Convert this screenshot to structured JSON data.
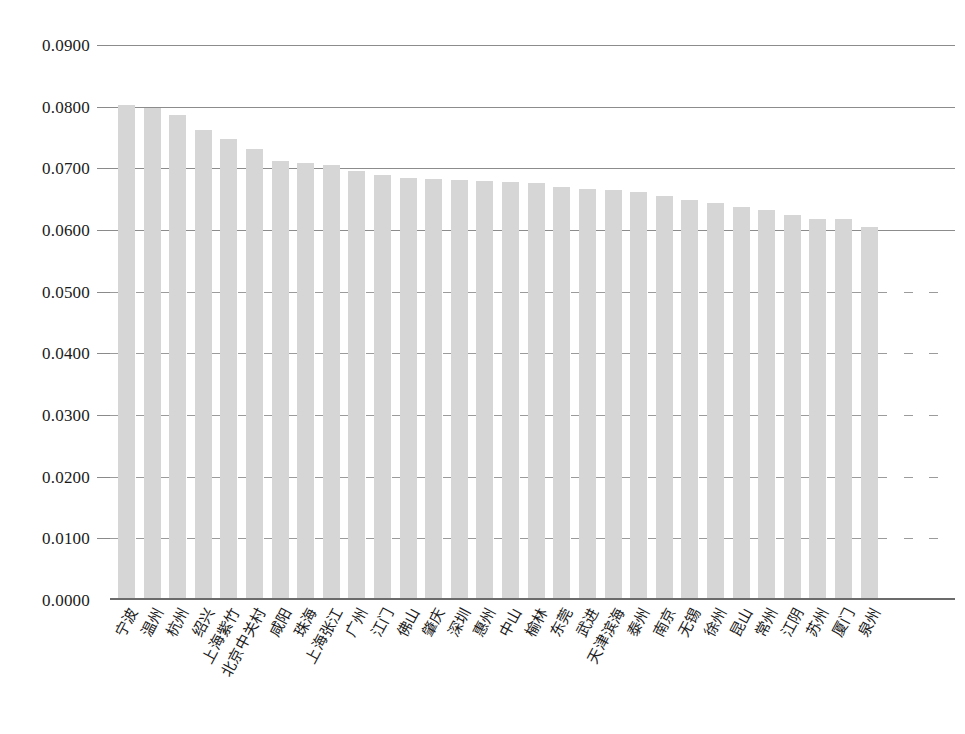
{
  "chart_data": {
    "type": "bar",
    "title": "",
    "subtitle": "",
    "xlabel": "",
    "ylabel": "",
    "ylim": [
      0.0,
      0.09
    ],
    "ytick_step": 0.01,
    "ytick_labels": [
      "0.0900",
      "0.0800",
      "0.0700",
      "0.0600",
      "0.0500",
      "0.0400",
      "0.0300",
      "0.0200",
      "0.0100",
      "0.0000"
    ],
    "ytick_values": [
      0.09,
      0.08,
      0.07,
      0.06,
      0.05,
      0.04,
      0.03,
      0.02,
      0.01,
      0.0
    ],
    "grid": "horizontal",
    "legend": "none",
    "bar_color": "#d6d6d6",
    "categories": [
      "宁波",
      "温州",
      "杭州",
      "绍兴",
      "上海紫竹",
      "北京中关村",
      "咸阳",
      "珠海",
      "上海张江",
      "广州",
      "江门",
      "佛山",
      "肇庆",
      "深圳",
      "惠州",
      "中山",
      "榆林",
      "东莞",
      "武进",
      "天津滨海",
      "泰州",
      "南京",
      "无锡",
      "徐州",
      "昆山",
      "常州",
      "江阴",
      "苏州",
      "厦门",
      "泉州"
    ],
    "values": [
      0.0803,
      0.0798,
      0.0787,
      0.0762,
      0.0748,
      0.0731,
      0.0712,
      0.0708,
      0.0705,
      0.0695,
      0.069,
      0.0685,
      0.0683,
      0.0681,
      0.0679,
      0.0678,
      0.0676,
      0.067,
      0.0667,
      0.0665,
      0.0662,
      0.0655,
      0.0649,
      0.0643,
      0.0637,
      0.0632,
      0.0624,
      0.0618,
      0.0618,
      0.0605
    ]
  },
  "axis": {
    "y_axis_name": "y-axis",
    "x_axis_name": "x-axis"
  }
}
